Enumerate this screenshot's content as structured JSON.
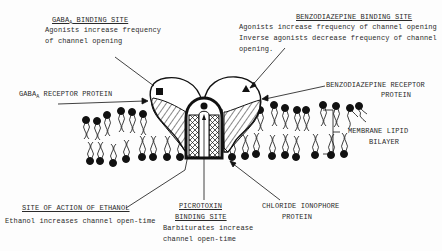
{
  "diagram": {
    "type": "GABA-A receptor / chloride ionophore complex schematic",
    "labels": {
      "gaba_site": {
        "title_main": "GABA",
        "title_sub": "A",
        "title_rest": " BINDING SITE",
        "line1": "Agonists increase frequency",
        "line2": "of channel opening"
      },
      "benzo_site": {
        "title": "BENZODIAZEPINE BINDING SITE",
        "line1": "Agonists increase frequency of channel opening",
        "line2": "Inverse agonists decrease frequency of channel",
        "line3": "opening."
      },
      "gaba_receptor": {
        "main": "GABA",
        "sub": "A",
        "rest": " RECEPTOR PROTEIN"
      },
      "benzo_receptor": {
        "line1": "BENZODIAZEPINE RECEPTOR",
        "line2": "PROTEIN"
      },
      "membrane": {
        "line1": "MEMBRANE LIPID",
        "line2": "BILAYER"
      },
      "ethanol": {
        "title": "SITE OF ACTION OF ETHANOL",
        "line1": "Ethanol increases channel open-time"
      },
      "picrotoxin": {
        "title1": "PICROTOXIN",
        "title2": "BINDING SITE",
        "line1": "Barbiturates increase",
        "line2": "channel open-time"
      },
      "chloride": {
        "line1": "CHLORIDE IONOPHORE",
        "line2": "PROTEIN"
      }
    },
    "colors": {
      "ink": "#111111",
      "paper": "#fdfdfd"
    }
  }
}
